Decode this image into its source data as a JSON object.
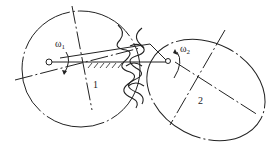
{
  "diagram": {
    "gear1": {
      "label": "1",
      "omega_label": "ω",
      "omega_sub": "1"
    },
    "gear2": {
      "label": "2",
      "omega_label": "ω",
      "omega_sub": "2"
    },
    "colors": {
      "line": "#222222",
      "background": "#ffffff"
    }
  }
}
